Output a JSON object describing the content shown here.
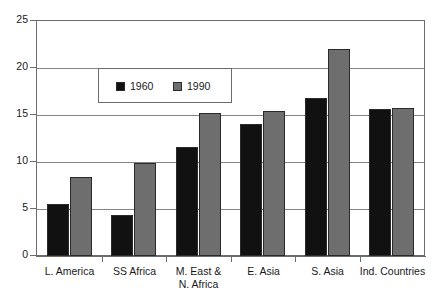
{
  "chart_data": {
    "type": "bar",
    "title": "",
    "xlabel": "",
    "ylabel": "",
    "ylim": [
      0,
      25
    ],
    "yticks": [
      0,
      5,
      10,
      15,
      20,
      25
    ],
    "ytick_labels": [
      "0",
      "5",
      "10",
      "15",
      "20",
      "25"
    ],
    "grid": true,
    "legend_position": "upper-left-inside",
    "categories": [
      "L. America",
      "SS Africa",
      "M. East &\nN. Africa",
      "E. Asia",
      "S. Asia",
      "Ind. Countries"
    ],
    "category_lines": [
      [
        "L. America"
      ],
      [
        "SS Africa"
      ],
      [
        "M. East &",
        "N. Africa"
      ],
      [
        "E. Asia"
      ],
      [
        "S. Asia"
      ],
      [
        "Ind. Countries"
      ]
    ],
    "series": [
      {
        "name": "1960",
        "color": "#111111",
        "values": [
          5.5,
          4.4,
          11.6,
          14.0,
          16.8,
          15.6
        ]
      },
      {
        "name": "1990",
        "color": "#6e6e6e",
        "values": [
          8.4,
          9.85,
          15.2,
          15.4,
          22.0,
          15.7
        ]
      }
    ]
  },
  "legend": {
    "entries": [
      {
        "label": "1960",
        "color": "#111111"
      },
      {
        "label": "1990",
        "color": "#6e6e6e"
      }
    ]
  },
  "colors": {
    "series_1960": "#111111",
    "series_1990": "#6e6e6e",
    "gridline": "#858585",
    "axis": "#6d6d6d",
    "background": "#ffffff",
    "text": "#1a1a1a"
  }
}
